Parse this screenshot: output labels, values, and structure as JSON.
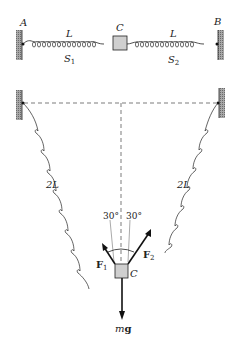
{
  "figure_top": {
    "point_left": "A",
    "point_right": "B",
    "block": "C",
    "spring_left": {
      "length_label": "L",
      "name": "S",
      "subscript": "1"
    },
    "spring_right": {
      "length_label": "L",
      "name": "S",
      "subscript": "2"
    }
  },
  "figure_bottom": {
    "spring_left_label": "2L",
    "spring_right_label": "2L",
    "angle_left": "30°",
    "angle_right": "30°",
    "force_left": {
      "name": "F",
      "subscript": "1"
    },
    "force_right": {
      "name": "F",
      "subscript": "2"
    },
    "block": "C",
    "weight": {
      "m": "m",
      "g": "g"
    }
  },
  "colors": {
    "line": "#222222",
    "wall_hatch": "#8a8a8a",
    "block_fill": "#cfcfcf"
  }
}
